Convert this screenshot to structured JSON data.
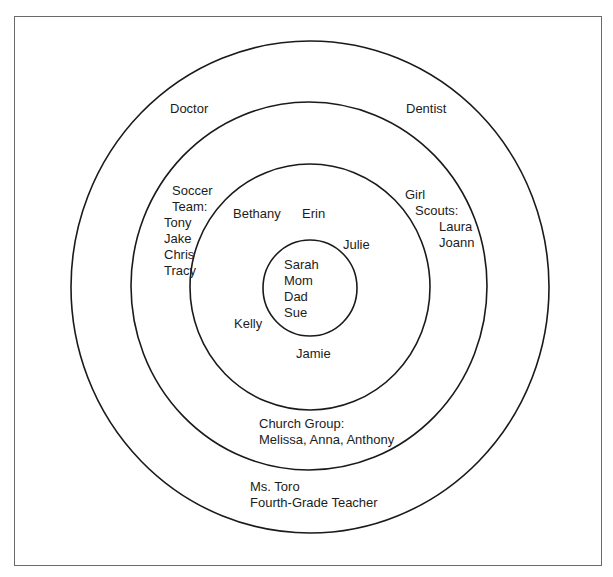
{
  "diagram": {
    "type": "concentric-circles",
    "title": "",
    "rings": [
      {
        "level": 1,
        "name": "inner",
        "members": [
          "Sarah",
          "Mom",
          "Dad",
          "Sue"
        ]
      },
      {
        "level": 2,
        "name": "close-friends",
        "members": [
          "Bethany",
          "Erin",
          "Julie",
          "Kelly",
          "Jamie"
        ]
      },
      {
        "level": 3,
        "name": "groups",
        "members": [
          "Soccer Team:",
          "Tony",
          "Jake",
          "Chris",
          "Tracy",
          "Girl",
          "Scouts:",
          "Laura",
          "Joann",
          "Church Group:",
          "Melissa, Anna, Anthony"
        ]
      },
      {
        "level": 4,
        "name": "outer",
        "members": [
          "Doctor",
          "Dentist",
          "Ms. Toro",
          "Fourth-Grade Teacher"
        ]
      }
    ],
    "labels": {
      "doctor": "Doctor",
      "dentist": "Dentist",
      "soccer": [
        "Soccer",
        "Team:",
        "Tony",
        "Jake",
        "Chris",
        "Tracy"
      ],
      "scouts": [
        "Girl",
        "Scouts:",
        "Laura",
        "Joann"
      ],
      "bethany": "Bethany",
      "erin": "Erin",
      "julie": "Julie",
      "kelly": "Kelly",
      "jamie": "Jamie",
      "center": [
        "Sarah",
        "Mom",
        "Dad",
        "Sue"
      ],
      "church": [
        "Church Group:",
        "Melissa, Anna, Anthony"
      ],
      "teacher": [
        "Ms. Toro",
        "Fourth-Grade Teacher"
      ]
    },
    "colors": {
      "stroke": "#1a1a1a",
      "frame": "#6a6a6a",
      "background": "#ffffff"
    }
  }
}
